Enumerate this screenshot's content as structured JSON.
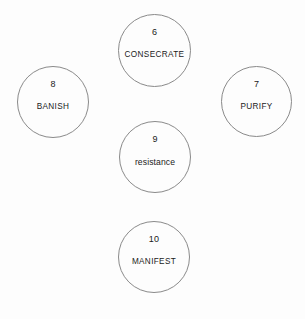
{
  "diagram": {
    "background_color": "#fdfdfd",
    "outline_color": "#8a8a8a",
    "text_color": "#1a1a1a",
    "nodes": [
      {
        "number": "6",
        "label": "CONSECRATE",
        "case": "upper",
        "x": 118,
        "y": 14,
        "size": 73
      },
      {
        "number": "8",
        "label": "BANISH",
        "case": "upper",
        "x": 17,
        "y": 66,
        "size": 72
      },
      {
        "number": "7",
        "label": "PURIFY",
        "case": "upper",
        "x": 221,
        "y": 66,
        "size": 71
      },
      {
        "number": "9",
        "label": "resistance",
        "case": "lower",
        "x": 119,
        "y": 121,
        "size": 72
      },
      {
        "number": "10",
        "label": "MANIFEST",
        "case": "upper",
        "x": 118,
        "y": 221,
        "size": 72
      }
    ]
  }
}
